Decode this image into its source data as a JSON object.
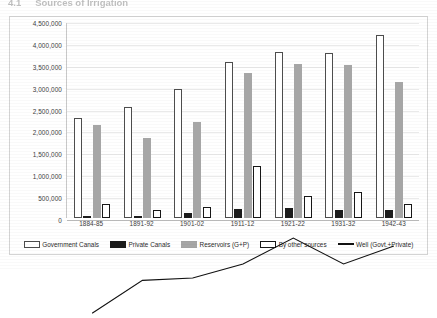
{
  "heading": {
    "number": "4.1",
    "text": "Sources of Irrigation"
  },
  "chart_data": {
    "type": "bar",
    "title": "",
    "xlabel": "",
    "ylabel": "",
    "ylim": [
      0,
      4500000
    ],
    "ytick_step": 500000,
    "grid": true,
    "legend_position": "bottom",
    "categories": [
      "1884-85",
      "1891-92",
      "1901-02",
      "1911-12",
      "1921-22",
      "1931-32",
      "1942-43"
    ],
    "ytick_labels": [
      "4,500,000",
      "4,000,000",
      "3,500,000",
      "3,000,000",
      "2,500,000",
      "2,000,000",
      "1,500,000",
      "1,000,000",
      "500,000",
      "0"
    ],
    "ytick_values": [
      4500000,
      4000000,
      3500000,
      3000000,
      2500000,
      2000000,
      1500000,
      1000000,
      500000,
      0
    ],
    "series": [
      {
        "name": "Government Canals",
        "kind": "bar",
        "color": "#ffffff",
        "border": "#4d4d4d",
        "values": [
          2290000,
          2530000,
          2940000,
          3560000,
          3790000,
          3780000,
          4170000
        ]
      },
      {
        "name": "Private Canals",
        "kind": "bar",
        "color": "#1c1c1c",
        "border": "#1c1c1c",
        "values": [
          20000,
          30000,
          110000,
          200000,
          235000,
          190000,
          180000
        ]
      },
      {
        "name": "Reservoirs (G+P)",
        "kind": "bar",
        "color": "#a6a6a6",
        "border": "#a6a6a6",
        "values": [
          2130000,
          1830000,
          2200000,
          3320000,
          3510000,
          3490000,
          3100000
        ]
      },
      {
        "name": "By other sources",
        "kind": "bar",
        "color": "#ffffff",
        "border": "#171717",
        "values": [
          330000,
          185000,
          255000,
          1190000,
          495000,
          605000,
          320000
        ]
      },
      {
        "name": "Well (Govt.+Private)",
        "kind": "line",
        "color": "#111111",
        "values": [
          790000,
          1210000,
          1240000,
          1420000,
          1750000,
          1420000,
          1650000
        ]
      }
    ]
  }
}
